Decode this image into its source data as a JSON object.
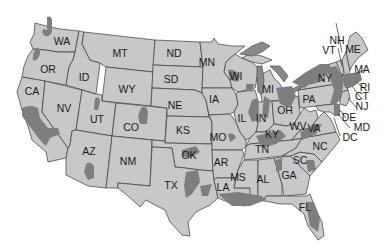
{
  "map": {
    "type": "US state map (grayscale) with shaded regions",
    "colors": {
      "background": "#ffffff",
      "state_fill": "#c8c8c8",
      "shaded_region": "#7e7e7e",
      "great_lakes": "#8a8a8a",
      "border": "#3a3a3a",
      "label": "#1a1a1a"
    },
    "states": [
      {
        "abbr": "WA"
      },
      {
        "abbr": "OR"
      },
      {
        "abbr": "CA"
      },
      {
        "abbr": "ID"
      },
      {
        "abbr": "NV"
      },
      {
        "abbr": "MT"
      },
      {
        "abbr": "WY"
      },
      {
        "abbr": "UT"
      },
      {
        "abbr": "AZ"
      },
      {
        "abbr": "CO"
      },
      {
        "abbr": "NM"
      },
      {
        "abbr": "ND"
      },
      {
        "abbr": "SD"
      },
      {
        "abbr": "NE"
      },
      {
        "abbr": "KS"
      },
      {
        "abbr": "OK"
      },
      {
        "abbr": "TX"
      },
      {
        "abbr": "MN"
      },
      {
        "abbr": "IA"
      },
      {
        "abbr": "MO"
      },
      {
        "abbr": "AR"
      },
      {
        "abbr": "LA"
      },
      {
        "abbr": "WI"
      },
      {
        "abbr": "IL"
      },
      {
        "abbr": "MS"
      },
      {
        "abbr": "MI"
      },
      {
        "abbr": "IN"
      },
      {
        "abbr": "KY"
      },
      {
        "abbr": "TN"
      },
      {
        "abbr": "AL"
      },
      {
        "abbr": "OH"
      },
      {
        "abbr": "WV"
      },
      {
        "abbr": "VA"
      },
      {
        "abbr": "NC"
      },
      {
        "abbr": "SC"
      },
      {
        "abbr": "GA"
      },
      {
        "abbr": "FL"
      },
      {
        "abbr": "PA"
      },
      {
        "abbr": "NY"
      },
      {
        "abbr": "VT"
      },
      {
        "abbr": "NH"
      },
      {
        "abbr": "ME"
      },
      {
        "abbr": "MA"
      },
      {
        "abbr": "RI"
      },
      {
        "abbr": "CT"
      },
      {
        "abbr": "NJ"
      },
      {
        "abbr": "DE"
      },
      {
        "abbr": "MD"
      },
      {
        "abbr": "DC"
      }
    ]
  }
}
